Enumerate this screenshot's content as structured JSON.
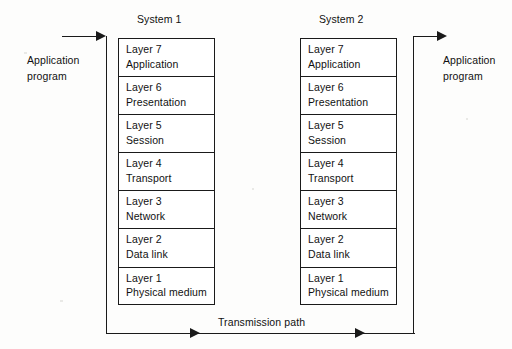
{
  "diagram": {
    "title_left": "System 1",
    "title_right": "System 2",
    "transmission_path_label": "Transmission path",
    "left_annotation": {
      "line1": "Application",
      "line2": "program"
    },
    "right_annotation": {
      "line1": "Application",
      "line2": "program"
    },
    "stroke_color": "#1a1a1a",
    "background_color": "#fdfdfc",
    "layers": [
      {
        "number": "Layer 7",
        "name": "Application"
      },
      {
        "number": "Layer 6",
        "name": "Presentation"
      },
      {
        "number": "Layer 5",
        "name": "Session"
      },
      {
        "number": "Layer 4",
        "name": "Transport"
      },
      {
        "number": "Layer 3",
        "name": "Network"
      },
      {
        "number": "Layer 2",
        "name": "Data link"
      },
      {
        "number": "Layer 1",
        "name": "Physical medium"
      }
    ]
  }
}
